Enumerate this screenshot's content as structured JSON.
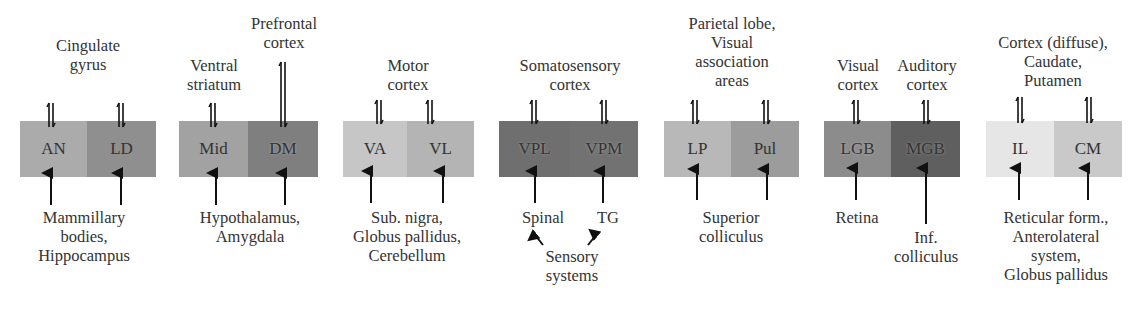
{
  "diagram": {
    "groups": [
      {
        "top_label": "Cingulate\ngyrus",
        "nuclei": [
          {
            "name": "AN",
            "color": "#ababab"
          },
          {
            "name": "LD",
            "color": "#8f8f8f"
          }
        ],
        "bottom_labels": [
          "Mammillary\nbodies,\nHippocampus"
        ]
      },
      {
        "top_labels": [
          "Ventral\nstriatum",
          "Prefrontal\ncortex"
        ],
        "nuclei": [
          {
            "name": "Mid",
            "color": "#a2a2a2"
          },
          {
            "name": "DM",
            "color": "#7f7f7f"
          }
        ],
        "bottom_labels": [
          "Hypothalamus,\nAmygdala"
        ]
      },
      {
        "top_label": "Motor\ncortex",
        "nuclei": [
          {
            "name": "VA",
            "color": "#c6c6c6"
          },
          {
            "name": "VL",
            "color": "#b4b4b4"
          }
        ],
        "bottom_labels": [
          "Sub. nigra,\nGlobus pallidus,\nCerebellum"
        ]
      },
      {
        "top_label": "Somatosensory\ncortex",
        "nuclei": [
          {
            "name": "VPL",
            "color": "#6f6f6f"
          },
          {
            "name": "VPM",
            "color": "#727272"
          }
        ],
        "bottom_labels": [
          "Spinal",
          "TG",
          "Sensory\nsystems"
        ]
      },
      {
        "top_label": "Parietal lobe,\nVisual\nassociation\nareas",
        "nuclei": [
          {
            "name": "LP",
            "color": "#b8b8b8"
          },
          {
            "name": "Pul",
            "color": "#9c9c9c"
          }
        ],
        "bottom_labels": [
          "Superior\ncolliculus"
        ]
      },
      {
        "top_labels": [
          "Visual\ncortex",
          "Auditory\ncortex"
        ],
        "nuclei": [
          {
            "name": "LGB",
            "color": "#8c8c8c"
          },
          {
            "name": "MGB",
            "color": "#5f5f5f"
          }
        ],
        "bottom_labels": [
          "Retina",
          "Inf.\ncolliculus"
        ]
      },
      {
        "top_label": "Cortex (diffuse),\nCaudate,\nPutamen",
        "nuclei": [
          {
            "name": "IL",
            "color": "#e6e6e6"
          },
          {
            "name": "CM",
            "color": "#c9c9c9"
          }
        ],
        "bottom_labels": [
          "Reticular form.,\nAnterolateral\nsystem,\nGlobus pallidus"
        ]
      }
    ]
  }
}
